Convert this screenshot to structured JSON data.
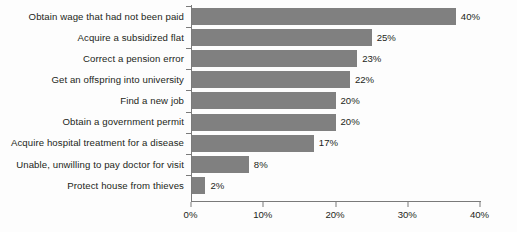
{
  "chart_data": {
    "type": "bar",
    "orientation": "horizontal",
    "title": "",
    "subtitle": "",
    "xlabel": "",
    "ylabel": "",
    "xlim": [
      0,
      40
    ],
    "grid": false,
    "legend": null,
    "bar_color": "#808080",
    "text_color": "#231f20",
    "axis_color": "#7a7a7a",
    "value_suffix": "%",
    "categories": [
      "Obtain wage that had not been paid",
      "Acquire a subsidized flat",
      "Correct a pension error",
      "Get an offspring into university",
      "Find a new job",
      "Obtain a government permit",
      "Acquire hospital treatment for a disease",
      "Unable, unwilling to pay doctor for visit",
      "Protect house from thieves"
    ],
    "values": [
      40,
      25,
      23,
      22,
      20,
      20,
      17,
      8,
      2
    ],
    "value_labels": [
      "40%",
      "25%",
      "23%",
      "22%",
      "20%",
      "20%",
      "17%",
      "8%",
      "2%"
    ],
    "xticks": [
      0,
      10,
      20,
      30,
      40
    ],
    "xtick_labels": [
      "0%",
      "10%",
      "20%",
      "30%",
      "40%"
    ]
  }
}
